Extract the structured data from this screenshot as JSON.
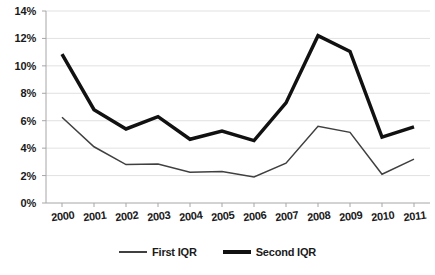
{
  "chart_data": {
    "type": "line",
    "title": "",
    "subtitle": "",
    "xlabel": "",
    "ylabel": "",
    "categories": [
      "2000",
      "2001",
      "2002",
      "2003",
      "2004",
      "2005",
      "2006",
      "2007",
      "2008",
      "2009",
      "2010",
      "2011"
    ],
    "series": [
      {
        "name": "First IQR",
        "values": [
          6.25,
          4.1,
          2.8,
          2.85,
          2.25,
          2.3,
          1.9,
          2.9,
          5.6,
          5.15,
          2.1,
          3.2
        ],
        "color": "#404040",
        "line_width": 1.5,
        "style": "thin"
      },
      {
        "name": "Second IQR",
        "values": [
          10.85,
          6.8,
          5.4,
          6.3,
          4.65,
          5.25,
          4.55,
          7.3,
          12.2,
          11.05,
          4.8,
          5.55
        ],
        "color": "#111111",
        "line_width": 3.5,
        "style": "thick"
      }
    ],
    "ylim": [
      0,
      14
    ],
    "y_tick_values": [
      0,
      2,
      4,
      6,
      8,
      10,
      12,
      14
    ],
    "y_tick_labels": [
      "0%",
      "2%",
      "4%",
      "6%",
      "8%",
      "10%",
      "12%",
      "14%"
    ],
    "y_tick_step": 2,
    "grid": true,
    "grid_axis": "y",
    "grid_color": "#d9d9d9",
    "axis_color": "#a6a6a6",
    "legend_position": "bottom",
    "legend_entries": [
      "First IQR",
      "Second IQR"
    ],
    "annotations": [],
    "background_color": "#ffffff"
  },
  "legend": {
    "entries": [
      {
        "label": "First IQR",
        "marker": "thin-line-swatch"
      },
      {
        "label": "Second IQR",
        "marker": "thick-line-swatch"
      }
    ]
  }
}
